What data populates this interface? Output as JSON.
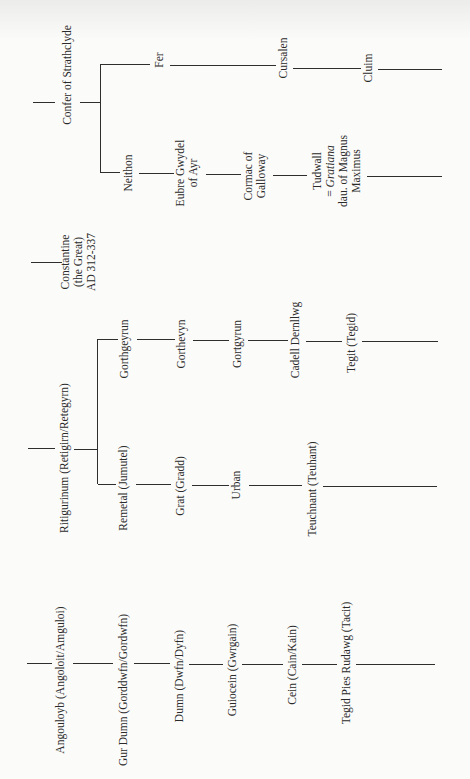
{
  "diagram": {
    "type": "genealogy-tree",
    "orientation": "rotated-90-ccw",
    "colors": {
      "background": "#fbfbf9",
      "line": "#2e2e2e",
      "text": "#2a2a2a"
    },
    "lineages": [
      {
        "id": "strathclyde",
        "root": {
          "label": "Confer of Strathclyde"
        },
        "branches": [
          {
            "id": "fer",
            "members": [
              {
                "label": "Fer"
              },
              {
                "label": "Cursalen"
              },
              {
                "label": "Cluim"
              }
            ]
          },
          {
            "id": "neithon",
            "members": [
              {
                "label": "Neithon"
              },
              {
                "lines": [
                  "Eubre Gwydel",
                  "of Ayr"
                ]
              },
              {
                "lines": [
                  "Cormac of",
                  "Galloway"
                ]
              },
              {
                "lines": [
                  "Tudwall",
                  "= Gratiana",
                  "dau. of Magnus",
                  "Maximus"
                ],
                "italic_word": "Gratiana"
              }
            ]
          }
        ]
      },
      {
        "id": "constantine",
        "root": {
          "lines": [
            "Constantine",
            "(the Great)",
            "AD 312-337"
          ]
        }
      },
      {
        "id": "ritigurinum",
        "root": {
          "label": "Ritigurinum (Retigirn/Retegyrn)"
        },
        "branches": [
          {
            "id": "gorthgeyrun",
            "members": [
              {
                "label": "Gorthgeyrun"
              },
              {
                "label": "Gorthevyn"
              },
              {
                "label": "Gortgyrun"
              },
              {
                "label": "Cadell Dernllwg"
              },
              {
                "label": "Tegit (Tegid)"
              }
            ]
          },
          {
            "id": "remetal",
            "members": [
              {
                "label": "Remetal (Jumutel)"
              },
              {
                "label": "Grat (Gradd)"
              },
              {
                "label": "Urban"
              },
              {
                "label": "Teuchnant (Teuhant)"
              }
            ]
          }
        ]
      },
      {
        "id": "angouloyb",
        "members": [
          {
            "label": "Angouloyb (Angoloit/Amguloi)"
          },
          {
            "label": "Gur Dumn (Gorddwfn/Gordwfn)"
          },
          {
            "label": "Dumn (Dwfn/Dyfn)"
          },
          {
            "label": "Guiocein (Gwrgain)"
          },
          {
            "label": "Cein (Cain/Kain)"
          },
          {
            "label": "Tegid Pies Rudawg (Tacit)"
          }
        ]
      }
    ]
  },
  "tudwall": {
    "name": "Tudwall",
    "eq": "= ",
    "spouse": "Gratiana",
    "line3": "dau. of Magnus",
    "line4": "Maximus"
  }
}
